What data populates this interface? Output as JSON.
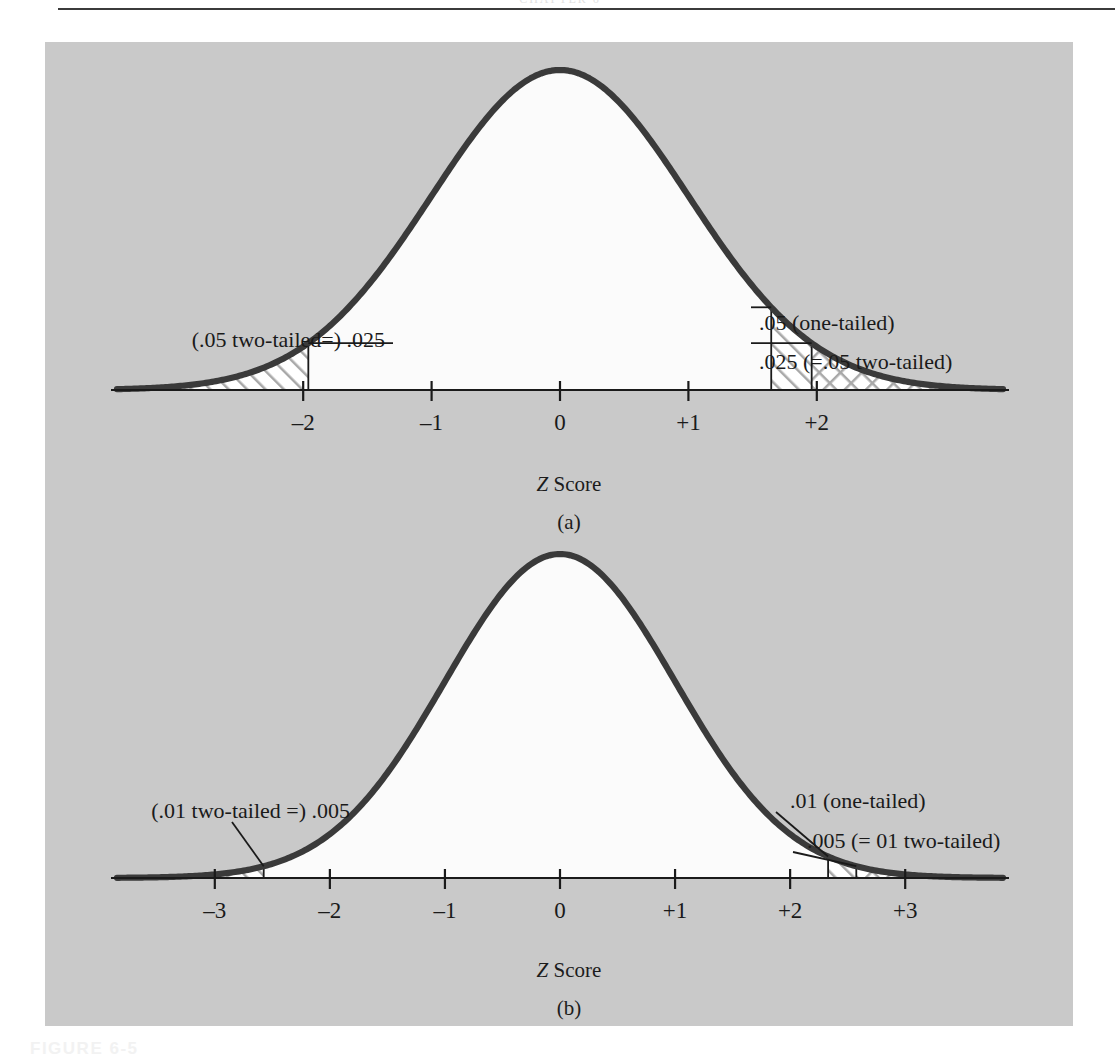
{
  "page": {
    "top_rule": true,
    "running_head_faint": "CHAPTER 6",
    "figure_caption_faint": "FIGURE 6-5",
    "panel_bg_color": "#c9c9c9",
    "curve_color": "#3a3a3a",
    "ink_color": "#1a1a1a"
  },
  "panels": [
    {
      "id": "a",
      "caption": "(a)",
      "xlabel_italic": "Z",
      "xlabel_rest": " Score",
      "ticks": [
        "–2",
        "–1",
        "0",
        "+1",
        "+2"
      ],
      "tick_values": [
        -2,
        -1,
        0,
        1,
        2
      ],
      "annotations": [
        {
          "name": "left-two-tailed-label",
          "text": "(.05 two-tailed=) .025",
          "side": "left"
        },
        {
          "name": "one-tailed-label",
          "text": ".05 (one-tailed)",
          "side": "right"
        },
        {
          "name": "right-two-tailed-label",
          "text": ".025 (=.05 two-tailed)",
          "side": "right"
        }
      ]
    },
    {
      "id": "b",
      "caption": "(b)",
      "xlabel_italic": "Z",
      "xlabel_rest": " Score",
      "ticks": [
        "–3",
        "–2",
        "–1",
        "0",
        "+1",
        "+2",
        "+3"
      ],
      "tick_values": [
        -3,
        -2,
        -1,
        0,
        1,
        2,
        3
      ],
      "annotations": [
        {
          "name": "left-two-tailed-label",
          "text": "(.01 two-tailed =) .005",
          "side": "left"
        },
        {
          "name": "one-tailed-label",
          "text": ".01 (one-tailed)",
          "side": "right"
        },
        {
          "name": "right-two-tailed-label",
          "text": ".005 (= 01 two-tailed)",
          "side": "right"
        }
      ]
    }
  ],
  "chart_data": {
    "type": "area",
    "xlabel": "Z Score",
    "ylabel": "",
    "grid": false,
    "legend_position": "inline-annotations",
    "charts": [
      {
        "panel": "a",
        "caption": "(a)",
        "distribution": "standard normal",
        "xlim": [
          -3.45,
          3.45
        ],
        "xticks": [
          -2,
          -1,
          0,
          1,
          2
        ],
        "xticklabels": [
          "–2",
          "–1",
          "0",
          "+1",
          "+2"
        ],
        "regions": [
          {
            "name": "left tail .025 (two-tailed)",
            "pattern": "diagonal-hatch",
            "from": -3.45,
            "to": -1.96,
            "area": 0.025,
            "label": "(.05 two-tailed=) .025"
          },
          {
            "name": "right tail .05 (one-tailed)",
            "pattern": "diagonal-hatch",
            "from": 1.645,
            "to": 3.45,
            "area": 0.05,
            "label": ".05 (one-tailed)"
          },
          {
            "name": "right tail .025 (two-tailed)",
            "pattern": "cross-hatch",
            "from": 1.96,
            "to": 3.45,
            "area": 0.025,
            "label": ".025 (=.05 two-tailed)"
          }
        ],
        "cutoffs": [
          {
            "z": -1.96,
            "alpha": 0.025,
            "tails": "two-tailed"
          },
          {
            "z": 1.645,
            "alpha": 0.05,
            "tails": "one-tailed"
          },
          {
            "z": 1.96,
            "alpha": 0.025,
            "tails": "two-tailed"
          }
        ]
      },
      {
        "panel": "b",
        "caption": "(b)",
        "distribution": "standard normal",
        "xlim": [
          -3.85,
          3.85
        ],
        "xticks": [
          -3,
          -2,
          -1,
          0,
          1,
          2,
          3
        ],
        "xticklabels": [
          "–3",
          "–2",
          "–1",
          "0",
          "+1",
          "+2",
          "+3"
        ],
        "regions": [
          {
            "name": "left tail .005 (two-tailed)",
            "pattern": "diagonal-hatch",
            "from": -3.85,
            "to": -2.575,
            "area": 0.005,
            "label": "(.01 two-tailed =) .005"
          },
          {
            "name": "right tail .01 (one-tailed)",
            "pattern": "diagonal-hatch",
            "from": 2.33,
            "to": 3.85,
            "area": 0.01,
            "label": ".01 (one-tailed)"
          },
          {
            "name": "right tail .005 (two-tailed)",
            "pattern": "cross-hatch",
            "from": 2.575,
            "to": 3.85,
            "area": 0.005,
            "label": ".005 (= 01 two-tailed)"
          }
        ],
        "cutoffs": [
          {
            "z": -2.575,
            "alpha": 0.005,
            "tails": "two-tailed"
          },
          {
            "z": 2.33,
            "alpha": 0.01,
            "tails": "one-tailed"
          },
          {
            "z": 2.575,
            "alpha": 0.005,
            "tails": "two-tailed"
          }
        ]
      }
    ]
  }
}
